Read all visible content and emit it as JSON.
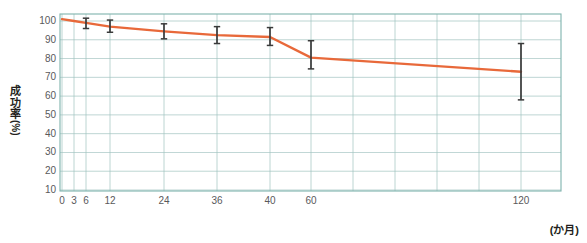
{
  "chart_data": {
    "type": "line",
    "title": "",
    "subtitle": "",
    "xlabel": "(か月)",
    "ylabel": "成功率(%)",
    "ylabel_chars": [
      "成",
      "功",
      "率"
    ],
    "ylabel_unit": "(%)",
    "x_unit_label": "(か月)",
    "xlim": [
      0,
      125
    ],
    "ylim": [
      8,
      103
    ],
    "y_ticks": [
      10,
      20,
      30,
      40,
      50,
      60,
      70,
      80,
      90,
      100
    ],
    "y_tick_labels": [
      "10",
      "20",
      "30",
      "40",
      "50",
      "60",
      "70",
      "80",
      "90",
      "100"
    ],
    "x_ticks": [
      0,
      3,
      6,
      12,
      24,
      36,
      40,
      60,
      120
    ],
    "x_tick_labels": [
      "0",
      "3",
      "6",
      "12",
      "24",
      "36",
      "40",
      "60",
      "120"
    ],
    "x_gridlines": [
      0,
      3,
      6,
      12,
      24,
      36,
      40,
      60,
      72,
      84,
      96,
      108,
      120
    ],
    "grid": true,
    "grid_color": "#9fc3bf",
    "axis_color": "#7fb3ad",
    "legend": [],
    "legend_position": "none",
    "series": [
      {
        "name": "成功率",
        "color": "#e8693a",
        "x": [
          0,
          3,
          6,
          12,
          24,
          36,
          40,
          60,
          120
        ],
        "values": [
          101,
          100,
          99,
          97,
          94.5,
          92.5,
          91.5,
          80.5,
          73
        ]
      }
    ],
    "error_bars": [
      {
        "x": 6,
        "value": 99,
        "low": 96,
        "high": 101.5
      },
      {
        "x": 12,
        "value": 97,
        "low": 94,
        "high": 100.5
      },
      {
        "x": 24,
        "value": 94.5,
        "low": 90.5,
        "high": 98.5
      },
      {
        "x": 36,
        "value": 92.5,
        "low": 88,
        "high": 97
      },
      {
        "x": 40,
        "value": 91.5,
        "low": 87,
        "high": 96.5
      },
      {
        "x": 60,
        "value": 80.5,
        "low": 74.5,
        "high": 89.5
      },
      {
        "x": 120,
        "value": 73,
        "low": 58,
        "high": 88
      }
    ],
    "error_bar_color": "#3a3a3a",
    "annotations": [],
    "background_color": "#ffffff"
  }
}
